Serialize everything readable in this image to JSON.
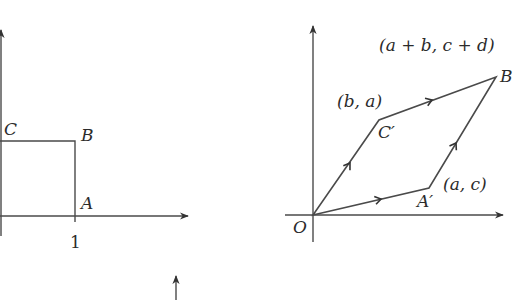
{
  "colors": {
    "stroke": "#4a4a4a",
    "text": "#2b2b2b",
    "background": "#ffffff"
  },
  "left_figure": {
    "description": "Unit square OABC before transformation (partially cropped on left)",
    "points": {
      "A": {
        "label": "A",
        "coords": [
          1,
          0
        ]
      },
      "B": {
        "label": "B",
        "coords": [
          1,
          1
        ]
      },
      "C": {
        "label": "C",
        "coords": [
          0,
          1
        ]
      }
    },
    "x_tick_label": "1"
  },
  "right_figure": {
    "description": "Parallelogram OA'B'C' image of unit square under linear transformation",
    "origin_label": "O",
    "points": {
      "A_prime": {
        "label": "A′",
        "coord_label": "(a, c)"
      },
      "C_prime": {
        "label": "C′",
        "coord_label": "(b, a)"
      },
      "B_prime": {
        "label": "B",
        "coord_label": "(a + b, c + d)"
      }
    }
  }
}
